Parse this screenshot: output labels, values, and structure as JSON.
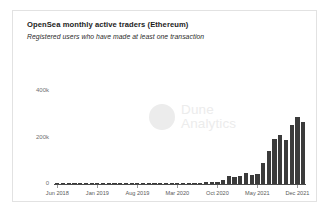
{
  "card": {
    "title": "OpenSea monthly active traders (Ethereum)",
    "subtitle": "Registered users who have made at least one transaction"
  },
  "watermark": {
    "line1": "Dune",
    "line2": "Analytics",
    "logo": "dune-circle-logo"
  },
  "colors": {
    "bar": "#3b3b3b",
    "axis": "#4a4a4a",
    "tick_label": "#5a5a5a",
    "watermark": "#ececec",
    "card_border": "#e2e2e2",
    "background": "#ffffff"
  },
  "chart_data": {
    "type": "bar",
    "title": "OpenSea monthly active traders (Ethereum)",
    "subtitle": "Registered users who have made at least one transaction",
    "xlabel": "",
    "ylabel": "",
    "ylim": [
      0,
      520000
    ],
    "yticks": [
      0,
      200000,
      400000
    ],
    "ytick_labels": [
      "0",
      "200k",
      "400k"
    ],
    "grid": false,
    "legend": null,
    "xtick_labels": [
      "Jun 2018",
      "Jan 2019",
      "Aug 2019",
      "Mar 2020",
      "Oct 2020",
      "May 2021",
      "Dec 2021"
    ],
    "xtick_indices": [
      0,
      7,
      14,
      21,
      28,
      35,
      42
    ],
    "categories": [
      "Jun 2018",
      "Jul 2018",
      "Aug 2018",
      "Sep 2018",
      "Oct 2018",
      "Nov 2018",
      "Dec 2018",
      "Jan 2019",
      "Feb 2019",
      "Mar 2019",
      "Apr 2019",
      "May 2019",
      "Jun 2019",
      "Jul 2019",
      "Aug 2019",
      "Sep 2019",
      "Oct 2019",
      "Nov 2019",
      "Dec 2019",
      "Jan 2020",
      "Feb 2020",
      "Mar 2020",
      "Apr 2020",
      "May 2020",
      "Jun 2020",
      "Jul 2020",
      "Aug 2020",
      "Sep 2020",
      "Oct 2020",
      "Nov 2020",
      "Dec 2020",
      "Jan 2021",
      "Feb 2021",
      "Mar 2021",
      "Apr 2021",
      "May 2021",
      "Jun 2021",
      "Jul 2021",
      "Aug 2021",
      "Sep 2021",
      "Oct 2021",
      "Nov 2021",
      "Dec 2021",
      "Jan 2022"
    ],
    "values": [
      1000,
      1200,
      1400,
      1300,
      1500,
      1600,
      1700,
      1800,
      1900,
      2100,
      2000,
      2200,
      2300,
      2400,
      2600,
      2700,
      2900,
      3000,
      3200,
      3400,
      3600,
      3500,
      3800,
      4200,
      5000,
      6000,
      7000,
      8000,
      9000,
      18000,
      36000,
      28000,
      33000,
      47000,
      40000,
      44000,
      90000,
      140000,
      195000,
      210000,
      190000,
      255000,
      290000,
      265000
    ],
    "values_pixel_tops": [
      173,
      173,
      173,
      173,
      173,
      172,
      172,
      172,
      172,
      172,
      172,
      172,
      172,
      171,
      171,
      171,
      171,
      171,
      171,
      171,
      170,
      170,
      170,
      170,
      170,
      169,
      168,
      167,
      166,
      160,
      154,
      157,
      155,
      150,
      153,
      151,
      143,
      138,
      130,
      128,
      131,
      121,
      117,
      120
    ],
    "peak": {
      "category": "Dec 2021",
      "value": 290000
    }
  }
}
